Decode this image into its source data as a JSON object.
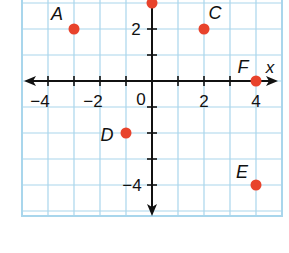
{
  "chart_data": {
    "type": "scatter",
    "title": "",
    "xlabel": "x",
    "ylabel": "",
    "xlim": [
      -5,
      5
    ],
    "ylim": [
      -5,
      3
    ],
    "grid": true,
    "legend": "none",
    "x_ticks": [
      -4,
      -3,
      -2,
      -1,
      0,
      1,
      2,
      3,
      4
    ],
    "y_ticks": [
      -4,
      -3,
      -2,
      -1,
      1,
      2
    ],
    "x_tick_labels": [
      "−4",
      "−2",
      "0",
      "2",
      "4"
    ],
    "y_tick_labels": [
      "2",
      "−4"
    ],
    "points": [
      {
        "label": "A",
        "x": -3,
        "y": 2
      },
      {
        "label": "B",
        "x": 0,
        "y": 3
      },
      {
        "label": "C",
        "x": 2,
        "y": 2
      },
      {
        "label": "D",
        "x": -1,
        "y": -2
      },
      {
        "label": "E",
        "x": 4,
        "y": -4
      },
      {
        "label": "F",
        "x": 4,
        "y": 0
      }
    ]
  },
  "colors": {
    "grid": "#a9d6ec",
    "border": "#a9d6ec",
    "axis": "#111111",
    "point": "#e8432c",
    "text": "#111111"
  },
  "labels": {
    "x_axis": "x",
    "origin": "0",
    "x_neg4": "−4",
    "x_neg2": "−2",
    "x_2": "2",
    "x_4": "4",
    "y_2": "2",
    "y_neg4": "−4",
    "point_A": "A",
    "point_C": "C",
    "point_D": "D",
    "point_E": "E",
    "point_F": "F"
  }
}
